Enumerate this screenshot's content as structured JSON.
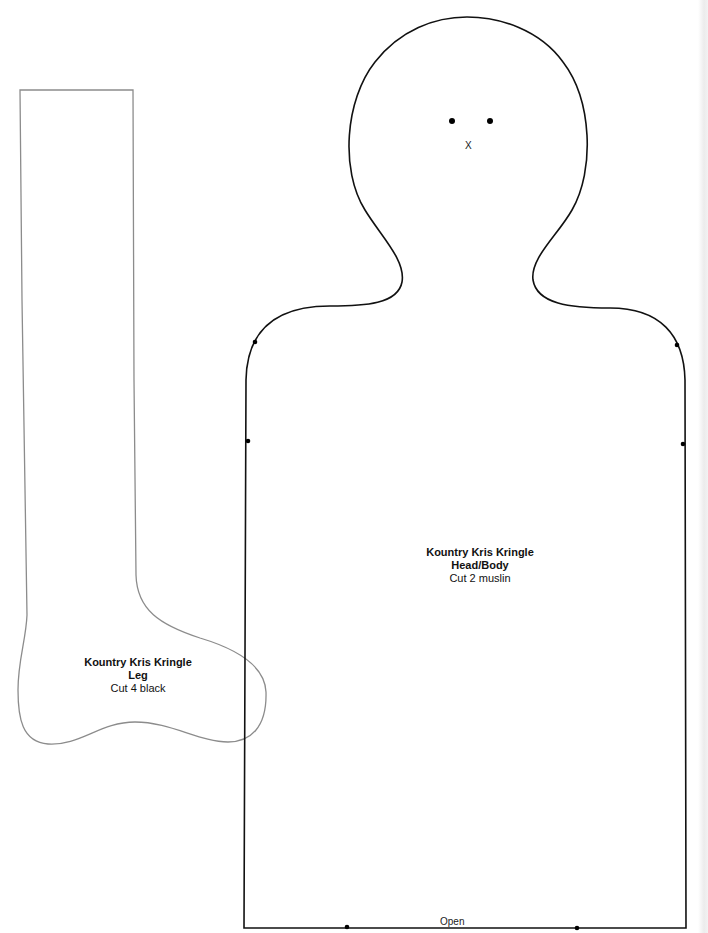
{
  "document": {
    "type": "sewing-pattern",
    "colors": {
      "body_outline": "#111111",
      "leg_outline": "#8c8c8c",
      "marker_dot": "#000000",
      "text": "#111111"
    }
  },
  "pieces": {
    "head_body": {
      "title": "Kountry Kris Kringle",
      "part": "Head/Body",
      "instruction": "Cut 2 muslin",
      "nose_mark": "X",
      "bottom_label": "Open",
      "eye_dots": 2,
      "side_markers": 4,
      "bottom_markers": 2
    },
    "leg": {
      "title": "Kountry Kris Kringle",
      "part": "Leg",
      "instruction": "Cut 4 black"
    }
  }
}
